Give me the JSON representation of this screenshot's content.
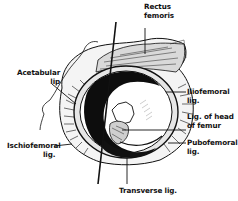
{
  "diagram": {
    "colors": {
      "ink": "#111111",
      "background": "#ffffff",
      "shade": "#bdbdbd"
    },
    "labels": [
      {
        "id": "rectus_femoris",
        "lines": [
          "Rectus",
          "femoris"
        ]
      },
      {
        "id": "acetabular_lip",
        "lines": [
          "Acetabular",
          "lip"
        ]
      },
      {
        "id": "iliofemoral_lig",
        "lines": [
          "Iliofemoral",
          "lig."
        ]
      },
      {
        "id": "lig_head_femur",
        "lines": [
          "Lig. of head",
          "of femur"
        ]
      },
      {
        "id": "pubofemoral_lig",
        "lines": [
          "Pubofemoral",
          "lig."
        ]
      },
      {
        "id": "ischiofemoral_lig",
        "lines": [
          "Ischiofemoral",
          "lig."
        ]
      },
      {
        "id": "transverse_lig",
        "lines": [
          "Transverse lig."
        ]
      }
    ]
  }
}
